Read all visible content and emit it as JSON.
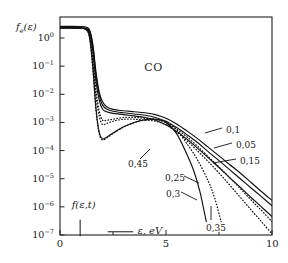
{
  "figure": {
    "species_label": "CO",
    "y_axis_label_parts": {
      "f": "f",
      "sub": "e",
      "arg": "(ε)"
    },
    "x_axis_label": "ε, eV",
    "distribution_annotation": "f(ε,t)",
    "frame_color": "#222222",
    "curve_color": "#111111",
    "background": "#ffffff"
  },
  "chart_data": {
    "type": "line",
    "title": "CO",
    "xlabel": "ε, eV",
    "ylabel": "f_e(ε)",
    "xlim": [
      0,
      10
    ],
    "ylim": [
      1e-07,
      3
    ],
    "yscale": "log",
    "grid": false,
    "legend": "inline-curve-labels",
    "xticks": [
      0,
      5,
      10
    ],
    "xminorticks": [
      2.5,
      7.5
    ],
    "yticks": [
      1,
      0.1,
      0.01,
      0.001,
      0.0001,
      1e-05,
      1e-06,
      1e-07
    ],
    "yticklabels": [
      "10^0",
      "10^-1",
      "10^-2",
      "10^-3",
      "10^-4",
      "10^-5",
      "10^-6",
      "10^-7"
    ],
    "series": [
      {
        "name": "0,05",
        "label": "0,05",
        "style": "solid",
        "x": [
          0.0,
          0.6,
          1.0,
          1.25,
          1.4,
          1.55,
          1.7,
          1.85,
          2.0,
          2.2,
          2.5,
          3.0,
          3.5,
          4.0,
          4.5,
          5.0,
          5.5,
          6.0,
          6.5,
          7.0,
          7.5,
          8.0,
          8.5,
          9.0,
          9.5,
          10.0
        ],
        "values": [
          2.6,
          2.6,
          2.55,
          2.4,
          1.9,
          0.6,
          0.06,
          0.012,
          0.0055,
          0.0036,
          0.0029,
          0.0026,
          0.0024,
          0.0022,
          0.0019,
          0.0014,
          0.00088,
          0.00049,
          0.00026,
          0.00013,
          6.5e-05,
          3.2e-05,
          1.6e-05,
          7.5e-06,
          3.5e-06,
          1.7e-06
        ]
      },
      {
        "name": "0,1",
        "label": "0,1",
        "style": "solid",
        "x": [
          0.0,
          0.6,
          1.0,
          1.25,
          1.4,
          1.55,
          1.7,
          1.85,
          2.0,
          2.2,
          2.5,
          3.0,
          3.5,
          4.0,
          4.5,
          5.0,
          5.5,
          6.0,
          6.5,
          7.0,
          7.5,
          8.0,
          8.5,
          9.0,
          9.5,
          10.0
        ],
        "values": [
          2.3,
          2.3,
          2.25,
          2.15,
          1.7,
          0.5,
          0.045,
          0.0095,
          0.0042,
          0.003,
          0.0025,
          0.0022,
          0.002,
          0.0018,
          0.0015,
          0.0011,
          0.00066,
          0.00036,
          0.00019,
          9e-05,
          4.4e-05,
          2.1e-05,
          1e-05,
          4.8e-06,
          2.3e-06,
          1.1e-06
        ]
      },
      {
        "name": "0,15",
        "label": "0,15",
        "style": "solid",
        "x": [
          0.0,
          0.6,
          1.0,
          1.25,
          1.4,
          1.55,
          1.7,
          1.85,
          2.0,
          2.2,
          2.5,
          3.0,
          3.5,
          4.0,
          4.5,
          5.0,
          5.5,
          6.0,
          6.5,
          7.0,
          7.5,
          8.0,
          8.5,
          9.0,
          9.5,
          10.0
        ],
        "values": [
          2.3,
          2.3,
          2.25,
          2.1,
          1.5,
          0.35,
          0.028,
          0.0062,
          0.003,
          0.0024,
          0.0021,
          0.0019,
          0.0017,
          0.0015,
          0.0012,
          0.00082,
          0.00048,
          0.00025,
          0.00012,
          5.5e-05,
          2.5e-05,
          1.1e-05,
          5e-06,
          2.2e-06,
          1e-06,
          4.5e-07
        ]
      },
      {
        "name": "0,25",
        "label": "0,25",
        "style": "dotted",
        "x": [
          0.0,
          0.6,
          1.0,
          1.25,
          1.4,
          1.55,
          1.7,
          1.85,
          2.0,
          2.2,
          2.5,
          3.0,
          3.5,
          4.0,
          4.5,
          5.0,
          5.5,
          6.0,
          6.5,
          7.0,
          7.5,
          8.0,
          8.5,
          9.0,
          9.5,
          10.0
        ],
        "values": [
          2.3,
          2.3,
          2.2,
          2.0,
          1.2,
          0.16,
          0.0085,
          0.0017,
          0.00085,
          0.00092,
          0.0011,
          0.0013,
          0.0013,
          0.0012,
          0.0011,
          0.00082,
          0.00046,
          0.00022,
          9.5e-05,
          4e-05,
          1.6e-05,
          6e-06,
          2.2e-06,
          8e-07,
          3e-07,
          1.1e-07
        ]
      },
      {
        "name": "0,3",
        "label": "0,3",
        "style": "solid",
        "x": [
          0.0,
          0.6,
          1.0,
          1.25,
          1.4,
          1.55,
          1.7,
          1.85,
          2.0,
          2.2,
          2.5,
          3.0,
          3.5,
          4.0,
          4.5,
          5.0,
          5.5,
          6.0,
          6.3,
          6.6,
          6.9
        ],
        "values": [
          2.3,
          2.3,
          2.2,
          1.95,
          1.0,
          0.09,
          0.003,
          0.00045,
          0.00026,
          0.0003,
          0.00042,
          0.0007,
          0.001,
          0.00125,
          0.0013,
          0.001,
          0.0004,
          7e-05,
          2e-05,
          3.5e-06,
          3e-07
        ]
      },
      {
        "name": "0,35",
        "label": "0,35",
        "style": "dotted",
        "x": [
          0.0,
          0.6,
          1.0,
          1.25,
          1.4,
          1.55,
          1.7,
          1.85,
          2.0,
          2.2,
          2.5,
          3.0,
          3.5,
          4.0,
          4.5,
          5.0,
          5.5,
          6.0,
          6.5,
          7.0,
          7.3,
          7.6
        ],
        "values": [
          2.3,
          2.3,
          2.2,
          1.9,
          0.95,
          0.075,
          0.0026,
          0.0004,
          0.00024,
          0.00028,
          0.0004,
          0.00068,
          0.00098,
          0.00122,
          0.00128,
          0.00105,
          0.00055,
          0.00017,
          4.5e-05,
          8e-06,
          2e-06,
          3e-07
        ]
      },
      {
        "name": "0,45",
        "label": "0,45",
        "style": "dotted",
        "x": [
          0.0,
          0.6,
          1.0,
          1.25,
          1.4,
          1.55,
          1.7,
          1.85,
          2.0,
          2.2,
          2.5,
          3.0,
          3.5,
          4.0,
          4.5,
          5.0,
          5.5,
          6.0,
          6.5,
          7.0,
          7.5,
          8.0,
          8.5,
          9.0,
          9.5,
          10.0
        ],
        "values": [
          2.3,
          2.3,
          2.2,
          2.05,
          1.35,
          0.22,
          0.013,
          0.0026,
          0.0012,
          0.0012,
          0.0013,
          0.0015,
          0.0015,
          0.0014,
          0.0013,
          0.00098,
          0.00058,
          0.0003,
          0.00014,
          6e-05,
          2.6e-05,
          1.1e-05,
          4.5e-06,
          1.8e-06,
          7.5e-07,
          3e-07
        ]
      }
    ],
    "annotations": [
      {
        "text": "CO",
        "x": 4.6,
        "y": 0.09
      },
      {
        "text": "f(ε,t)",
        "x": 0.75,
        "y": 1.8e-06
      },
      {
        "text": "ε, eV",
        "x": 3.9,
        "y": 1.2e-07
      }
    ]
  },
  "curve_labels": [
    {
      "text": "0,1",
      "px": 226,
      "py": 126
    },
    {
      "text": "0,05",
      "px": 236,
      "py": 141
    },
    {
      "text": "0,15",
      "px": 240,
      "py": 157
    },
    {
      "text": "0,45",
      "px": 128,
      "py": 160
    },
    {
      "text": "0,25",
      "px": 165,
      "py": 174
    },
    {
      "text": "0,3",
      "px": 166,
      "py": 190
    },
    {
      "text": "0,35",
      "px": 206,
      "py": 224
    }
  ]
}
